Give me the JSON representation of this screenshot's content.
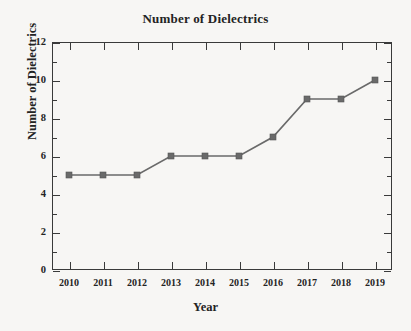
{
  "chart_data": {
    "type": "line",
    "title": "Number of Dielectrics",
    "xlabel": "Year",
    "ylabel": "Number of Dielectrics",
    "categories": [
      "2010",
      "2011",
      "2012",
      "2013",
      "2014",
      "2015",
      "2016",
      "2017",
      "2018",
      "2019"
    ],
    "x": [
      2010,
      2011,
      2012,
      2013,
      2014,
      2015,
      2016,
      2017,
      2018,
      2019
    ],
    "values": [
      5,
      5,
      5,
      6,
      6,
      6,
      7,
      9,
      9,
      10
    ],
    "series": [
      {
        "name": "Number of Dielectrics",
        "values": [
          5,
          5,
          5,
          6,
          6,
          6,
          7,
          9,
          9,
          10
        ]
      }
    ],
    "ylim": [
      0,
      12
    ],
    "xlim": [
      2009.5,
      2019.5
    ],
    "y_ticks": [
      0,
      2,
      4,
      6,
      8,
      10,
      12
    ],
    "y_tick_labels": [
      "0",
      "2",
      "4",
      "6",
      "8",
      "10",
      "12"
    ],
    "y_minor_ticks": [
      1,
      3,
      5,
      7,
      9,
      11
    ],
    "x_tick_labels": [
      "2010",
      "2011",
      "2012",
      "2013",
      "2014",
      "2015",
      "2016",
      "2017",
      "2018",
      "2019"
    ],
    "grid": false,
    "legend": null,
    "legend_position": "none",
    "marker": "square",
    "marker_color": "#6a6a6a",
    "line_color": "#6a6a6a",
    "axis_color": "#3a3a3a",
    "background_color": "#f7f6f4",
    "text_color": "#232323"
  }
}
